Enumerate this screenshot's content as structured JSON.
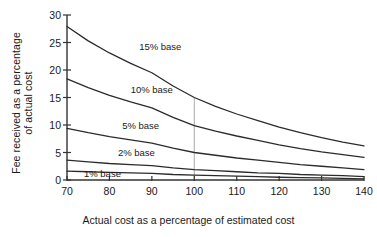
{
  "chart_data": {
    "type": "line",
    "title": "",
    "xlabel": "Actual cost as a percentage of estimated cost",
    "ylabel_line1": "Fee received as a percentage",
    "ylabel_line2": "of actual cost",
    "xlim": [
      70,
      140
    ],
    "ylim": [
      0,
      30
    ],
    "xticks": [
      70,
      80,
      90,
      100,
      110,
      120,
      130,
      140
    ],
    "yticks": [
      0,
      5,
      10,
      15,
      20,
      25,
      30
    ],
    "grid": false,
    "legend_position": "inline-annotations",
    "annotations": [
      {
        "text": "15% base",
        "x": 87,
        "y": 24.2
      },
      {
        "text": "10% base",
        "x": 85,
        "y": 16.3
      },
      {
        "text": "5% base",
        "x": 83,
        "y": 9.8
      },
      {
        "text": "2% base",
        "x": 82,
        "y": 5.0
      },
      {
        "text": "1% base",
        "x": 74,
        "y": 1.1
      }
    ],
    "reference_line": {
      "x": 100,
      "y_from": 0,
      "y_to": 15.0,
      "color": "#aaaaaa"
    },
    "x": [
      70,
      75,
      80,
      85,
      90,
      95,
      100,
      105,
      110,
      115,
      120,
      125,
      130,
      135,
      140
    ],
    "series": [
      {
        "name": "15% base",
        "values": [
          27.9,
          25.3,
          23.1,
          21.2,
          19.5,
          17.1,
          15.0,
          13.4,
          12.0,
          10.8,
          9.6,
          8.6,
          7.7,
          6.9,
          6.2
        ]
      },
      {
        "name": "10% base",
        "values": [
          18.4,
          16.8,
          15.4,
          14.2,
          13.1,
          11.4,
          9.9,
          8.9,
          8.0,
          7.2,
          6.4,
          5.7,
          5.1,
          4.6,
          4.1
        ]
      },
      {
        "name": "5% base",
        "values": [
          9.4,
          8.6,
          7.9,
          7.3,
          6.7,
          5.8,
          5.0,
          4.5,
          4.0,
          3.6,
          3.2,
          2.8,
          2.5,
          2.2,
          1.9
        ]
      },
      {
        "name": "2% base",
        "values": [
          3.6,
          3.3,
          3.0,
          2.8,
          2.6,
          2.2,
          1.9,
          1.7,
          1.5,
          1.3,
          1.2,
          1.0,
          0.9,
          0.8,
          0.6
        ]
      },
      {
        "name": "1% base",
        "values": [
          1.6,
          1.5,
          1.4,
          1.3,
          1.2,
          1.0,
          0.9,
          0.8,
          0.7,
          0.6,
          0.5,
          0.45,
          0.4,
          0.3,
          0.2
        ]
      }
    ],
    "series_color": "#2b2b2b"
  }
}
